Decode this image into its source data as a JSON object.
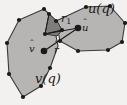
{
  "figure": {
    "type": "geometric-diagram",
    "caption_labels": {
      "upper_polygon": "u(q)",
      "lower_polygon": "v(q)",
      "edge_label": "r",
      "edge_label_subscript": "1",
      "point_u": "u",
      "point_v": "v",
      "point_r": "r",
      "hat_accent": "̂"
    },
    "colors": {
      "background": "#f2f1ef",
      "polygon_fill": "#b6b5b3",
      "wedge_fill": "#7e7d7b",
      "stroke": "#3a3a3a",
      "vertex_fill": "#1a1a1a",
      "label_color": "#1a1a1a"
    },
    "geometry": {
      "v_polygon_points": "19,20 44,9 56,21 62,30 56,36 58,46 50,68 41,86 23,97 9,74 7,43",
      "u_polygon_points": "56,21 86,7 110,6 125,23 122,42 108,50 78,51 60,41",
      "wedge_points": "45,34 49,14 57,21 62,30 57,36",
      "vertices_v": [
        {
          "x": 19,
          "y": 20
        },
        {
          "x": 44,
          "y": 9
        },
        {
          "x": 56,
          "y": 21
        },
        {
          "x": 62,
          "y": 30
        },
        {
          "x": 50,
          "y": 68
        },
        {
          "x": 41,
          "y": 86
        },
        {
          "x": 23,
          "y": 97
        },
        {
          "x": 9,
          "y": 74
        },
        {
          "x": 7,
          "y": 43
        }
      ],
      "vertices_u": [
        {
          "x": 86,
          "y": 7
        },
        {
          "x": 110,
          "y": 6
        },
        {
          "x": 125,
          "y": 23
        },
        {
          "x": 122,
          "y": 42
        },
        {
          "x": 108,
          "y": 50
        },
        {
          "x": 78,
          "y": 51
        },
        {
          "x": 60,
          "y": 41
        }
      ],
      "point_v_hat": {
        "x": 44,
        "y": 51
      },
      "point_u_hat": {
        "x": 78,
        "y": 28
      },
      "wedge_apex": {
        "x": 45,
        "y": 34
      },
      "segments": [
        {
          "from": {
            "x": 44,
            "y": 51
          },
          "to": {
            "x": 78,
            "y": 28
          },
          "name": "v-to-u"
        },
        {
          "from": {
            "x": 45,
            "y": 34
          },
          "to": {
            "x": 78,
            "y": 28
          },
          "name": "apex-to-u"
        },
        {
          "from": {
            "x": 45,
            "y": 34
          },
          "to": {
            "x": 62,
            "y": 30
          },
          "name": "wedge-right"
        },
        {
          "from": {
            "x": 45,
            "y": 34
          },
          "to": {
            "x": 49,
            "y": 14
          },
          "name": "wedge-left"
        }
      ]
    }
  }
}
